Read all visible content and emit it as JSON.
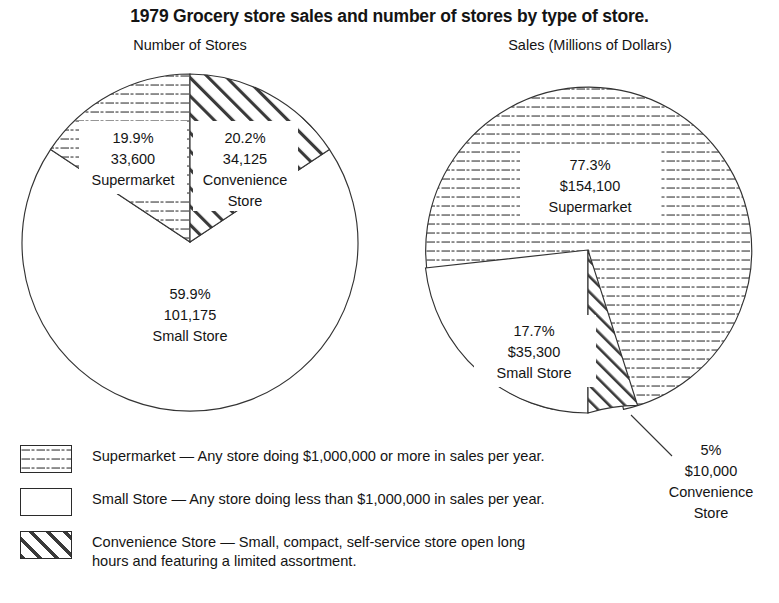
{
  "title": "1979 Grocery store sales and number of stores by type of store.",
  "panels": {
    "left": {
      "subtitle": "Number of Stores"
    },
    "right": {
      "subtitle": "Sales (Millions of Dollars)"
    }
  },
  "labels": {
    "left": {
      "supermarket": {
        "pct": "19.9%",
        "value": "33,600",
        "name": "Supermarket"
      },
      "convenience": {
        "pct": "20.2%",
        "value": "34,125",
        "name": "Convenience",
        "name2": "Store"
      },
      "small": {
        "pct": "59.9%",
        "value": "101,175",
        "name": "Small Store"
      }
    },
    "right": {
      "supermarket": {
        "pct": "77.3%",
        "value": "$154,100",
        "name": "Supermarket"
      },
      "small": {
        "pct": "17.7%",
        "value": "$35,300",
        "name": "Small Store"
      },
      "convenience": {
        "pct": "5%",
        "value": "$10,000",
        "name": "Convenience",
        "name2": "Store"
      }
    }
  },
  "legend": [
    {
      "pattern": "horizontal-dashes",
      "swatch_name": "supermarket-swatch",
      "text": "Supermarket — Any store doing $1,000,000 or more in sales per year."
    },
    {
      "pattern": "solid-white",
      "swatch_name": "small-store-swatch",
      "text": "Small Store — Any store doing less than $1,000,000 in sales per year."
    },
    {
      "pattern": "diagonal-hatch",
      "swatch_name": "convenience-store-swatch",
      "text": "Convenience Store — Small, compact, self-service store open long\n                              hours and featuring a limited assortment."
    }
  ],
  "chart_data": [
    {
      "type": "pie",
      "title": "Number of Stores",
      "categories": [
        "Supermarket",
        "Convenience Store",
        "Small Store"
      ],
      "values": [
        33600,
        34125,
        101175
      ],
      "percentages": [
        19.9,
        20.2,
        59.9
      ],
      "labels": [
        "19.9% 33,600 Supermarket",
        "20.2% 34,125 Convenience Store",
        "59.9% 101,175 Small Store"
      ],
      "patterns": [
        "horizontal-dashes",
        "diagonal-hatch",
        "solid-white"
      ],
      "start_angle_deg": 0,
      "legend": "below",
      "grid": false
    },
    {
      "type": "pie",
      "title": "Sales (Millions of Dollars)",
      "categories": [
        "Supermarket",
        "Small Store",
        "Convenience Store"
      ],
      "values": [
        154100,
        35300,
        10000
      ],
      "percentages": [
        77.3,
        17.7,
        5.0
      ],
      "labels": [
        "77.3% $154,100 Supermarket",
        "17.7% $35,300 Small Store",
        "5% $10,000 Convenience Store"
      ],
      "patterns": [
        "horizontal-dashes",
        "solid-white",
        "diagonal-hatch"
      ],
      "units": "Millions of Dollars",
      "legend": "below",
      "grid": false
    }
  ]
}
